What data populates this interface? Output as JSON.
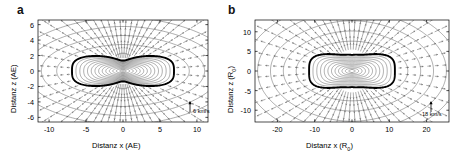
{
  "figure": {
    "background": "#ffffff",
    "line_color": "#555555",
    "bold_contour_color": "#000000",
    "vector_color": "#666666"
  },
  "panels": [
    {
      "id": "a",
      "letter": "a",
      "xlabel_prefix": "Distanz  x (AE)",
      "ylabel_prefix": "Distanz  z (AE)",
      "xlabel_main": "Distanz  x (AE)",
      "ylabel_main": "Distanz  z (AE)",
      "xticks": [
        "-10",
        "-5",
        "0",
        "5",
        "10"
      ],
      "xtick_values": [
        -10,
        -5,
        0,
        5,
        10
      ],
      "yticks": [
        "6",
        "4",
        "2",
        "0",
        "-2",
        "-4",
        "-6"
      ],
      "ytick_values": [
        6,
        4,
        2,
        0,
        -2,
        -4,
        -6
      ],
      "xlim": [
        -11.5,
        11.5
      ],
      "ylim": [
        -6.6,
        6.6
      ],
      "scale_arrow_label": "6 km/s",
      "scale_arrow_value": 6,
      "scale_arrow_unit": "km/s"
    },
    {
      "id": "b",
      "letter": "b",
      "xlabel_main": "Distanz  x (R",
      "xlabel_sub": "0",
      "xlabel_suffix": ")",
      "ylabel_main": "Distanz  z (R",
      "ylabel_sub": "0",
      "ylabel_suffix": ")",
      "xticks": [
        "-20",
        "-10",
        "0",
        "10",
        "20"
      ],
      "xtick_values": [
        -20,
        -10,
        0,
        10,
        20
      ],
      "yticks": [
        "10",
        "5",
        "0",
        "-5",
        "-10"
      ],
      "ytick_values": [
        10,
        5,
        0,
        -5,
        -10
      ],
      "xlim": [
        -26,
        26
      ],
      "ylim": [
        -13,
        13
      ],
      "scale_arrow_label": "18 km/s",
      "scale_arrow_value": 18,
      "scale_arrow_unit": "km/s"
    }
  ],
  "chart_data": {
    "type": "contour",
    "title": "",
    "panels": [
      {
        "name": "a",
        "xlabel": "Distanz x (AE)",
        "ylabel": "Distanz z (AE)",
        "xlim": [
          -11.5,
          11.5
        ],
        "ylim": [
          -6.6,
          6.6
        ],
        "xticks": [
          -10,
          -5,
          0,
          5,
          10
        ],
        "yticks": [
          -6,
          -4,
          -2,
          0,
          2,
          4,
          6
        ],
        "grid": false,
        "bold_contour": {
          "shape": "peanut",
          "half_width_x": 6.9,
          "waist_half_height_z": 1.35,
          "lobe_half_height_z": 2.25,
          "lobe_center_x": 4.2
        },
        "inner_contours": 13,
        "outer_contours": 4,
        "vector_field": "radial outflow, density increases toward poles",
        "scale_arrow": {
          "value": 6,
          "unit": "km/s",
          "label": "6 km/s"
        }
      },
      {
        "name": "b",
        "xlabel": "Distanz x (R0)",
        "ylabel": "Distanz z (R0)",
        "xlim": [
          -26,
          26
        ],
        "ylim": [
          -13,
          13
        ],
        "xticks": [
          -20,
          -10,
          0,
          10,
          20
        ],
        "yticks": [
          -10,
          -5,
          0,
          5,
          10
        ],
        "grid": false,
        "bold_contour": {
          "shape": "clover",
          "half_width_x": 11.5,
          "waist_half_height_z": 2.6,
          "lobe_half_height_z": 5.0,
          "lobe_center_x": 5.5
        },
        "inner_contours": 11,
        "outer_contours": 5,
        "vector_field": "radial outflow, density increases toward poles",
        "scale_arrow": {
          "value": 18,
          "unit": "km/s",
          "label": "18 km/s"
        }
      }
    ]
  }
}
